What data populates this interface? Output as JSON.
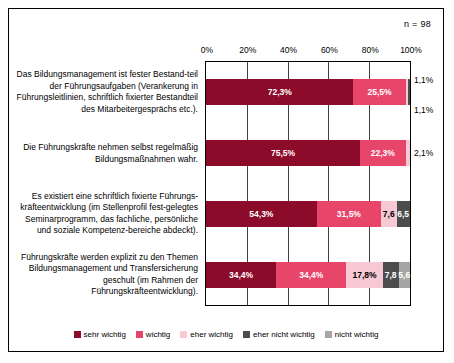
{
  "sample_note": "n = 98",
  "chart_data": {
    "type": "bar",
    "orientation": "horizontal",
    "stacked": true,
    "stack_mode": "percent",
    "title": "",
    "xlabel": "",
    "ylabel": "",
    "xlim": [
      0,
      100
    ],
    "xticks": [
      "0%",
      "20%",
      "40%",
      "60%",
      "80%",
      "100%"
    ],
    "xtick_values": [
      0,
      20,
      40,
      60,
      80,
      100
    ],
    "grid": true,
    "legend_position": "bottom",
    "categories": [
      "Das Bildungsmanagement ist fester Bestand-teil der Führungsaufgaben (Verankerung in Führungsleitlinien, schriftlich fixierter Bestandteil des Mitarbeitergesprächs etc.).",
      "Die Führungskräfte nehmen selbst regelmäßig Bildungsmaßnahmen wahr.",
      "Es existiert eine schriftlich fixierte Führungs-kräfteentwicklung (im Stellenprofil fest-gelegtes Seminarprogramm, das fachliche, persönliche und soziale Kompetenz-bereiche abdeckt).",
      "Führungskräfte werden explizit zu den Themen Bildungsmanagement und Transfersicherung geschult (im Rahmen der Führungskräfteentwicklung)."
    ],
    "series": [
      {
        "name": "sehr wichtig",
        "color": "#8d0b2a",
        "values": [
          72.3,
          75.5,
          54.3,
          34.4
        ]
      },
      {
        "name": "wichtig",
        "color": "#e8456b",
        "values": [
          25.5,
          22.3,
          31.5,
          34.4
        ]
      },
      {
        "name": "eher wichtig",
        "color": "#f6c9d4",
        "values": [
          1.1,
          2.1,
          7.6,
          17.8
        ]
      },
      {
        "name": "eher nicht wichtig",
        "color": "#4d4d4d",
        "values": [
          1.1,
          0.0,
          6.5,
          7.8
        ]
      },
      {
        "name": "nicht wichtig",
        "color": "#a6a6a6",
        "values": [
          0.0,
          0.0,
          0.0,
          5.6
        ]
      }
    ],
    "bar_labels": [
      [
        {
          "text": "72,3%",
          "inside": true,
          "dark": false
        },
        {
          "text": "25,5%",
          "inside": true,
          "dark": false
        },
        {
          "text": "1,1%",
          "inside": false,
          "dark": true
        },
        {
          "text": "1,1%",
          "inside": false,
          "dark": true
        }
      ],
      [
        {
          "text": "75,5%",
          "inside": true,
          "dark": false
        },
        {
          "text": "22,3%",
          "inside": true,
          "dark": false
        },
        {
          "text": "2,1%",
          "inside": false,
          "dark": true
        }
      ],
      [
        {
          "text": "54,3%",
          "inside": true,
          "dark": false
        },
        {
          "text": "31,5%",
          "inside": true,
          "dark": false
        },
        {
          "text": "7,6",
          "inside": true,
          "dark": true
        },
        {
          "text": "6,5",
          "inside": true,
          "dark": false
        }
      ],
      [
        {
          "text": "34,4%",
          "inside": true,
          "dark": false
        },
        {
          "text": "34,4%",
          "inside": true,
          "dark": false
        },
        {
          "text": "17,8%",
          "inside": true,
          "dark": true
        },
        {
          "text": "7,8",
          "inside": true,
          "dark": false
        },
        {
          "text": "5,6",
          "inside": true,
          "dark": false
        }
      ]
    ]
  }
}
